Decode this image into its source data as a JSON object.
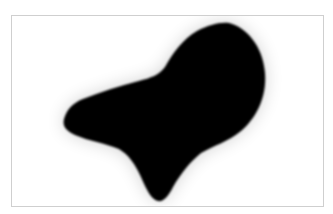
{
  "caption": {
    "text": ""
  },
  "image": {
    "subject": "black-silhouette",
    "background_color": "#ffffff",
    "shape_color": "#000000",
    "border_color": "#cfcfcf"
  }
}
